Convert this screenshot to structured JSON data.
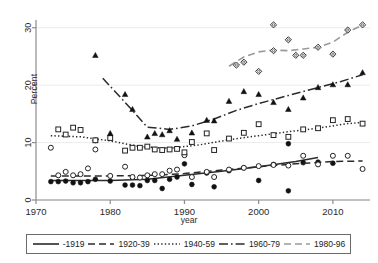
{
  "chart_data": {
    "type": "scatter",
    "title": "",
    "xlabel": "year",
    "ylabel": "Percent",
    "xlim": [
      1970,
      2015
    ],
    "ylim": [
      0,
      31
    ],
    "xticks": [
      1970,
      1980,
      1990,
      2000,
      2010
    ],
    "yticks": [
      0,
      10,
      20,
      30
    ],
    "grid": "horizontal-faint",
    "legend_position": "bottom",
    "series": [
      {
        "name": "-1919",
        "label": "-1919",
        "line_style": "solid",
        "marker": "filled-circle",
        "color": "#2b2b2b",
        "points": [
          {
            "x": 1972,
            "y": 3.2
          },
          {
            "x": 1973,
            "y": 3.2
          },
          {
            "x": 1974,
            "y": 3.3
          },
          {
            "x": 1975,
            "y": 3.0
          },
          {
            "x": 1976,
            "y": 3.0
          },
          {
            "x": 1977,
            "y": 3.2
          },
          {
            "x": 1978,
            "y": 3.6
          },
          {
            "x": 1980,
            "y": 3.3
          },
          {
            "x": 1982,
            "y": 2.6
          },
          {
            "x": 1983,
            "y": 2.6
          },
          {
            "x": 1984,
            "y": 2.5
          },
          {
            "x": 1985,
            "y": 3.4
          },
          {
            "x": 1986,
            "y": 3.4
          },
          {
            "x": 1987,
            "y": 2.0
          },
          {
            "x": 1988,
            "y": 3.6
          },
          {
            "x": 1989,
            "y": 4.0
          },
          {
            "x": 1990,
            "y": 6.3
          },
          {
            "x": 1991,
            "y": 2.7
          },
          {
            "x": 1993,
            "y": 4.7
          },
          {
            "x": 1994,
            "y": 2.3
          },
          {
            "x": 1996,
            "y": 5.1
          },
          {
            "x": 1998,
            "y": 5.6
          },
          {
            "x": 2000,
            "y": 3.4
          },
          {
            "x": 2002,
            "y": 6.2
          },
          {
            "x": 2004,
            "y": 9.8
          },
          {
            "x": 2004,
            "y": 1.6
          },
          {
            "x": 2006,
            "y": 6.5
          },
          {
            "x": 2008,
            "y": 6.6
          },
          {
            "x": 2010,
            "y": 6.4
          }
        ],
        "fit": [
          {
            "x": 1972,
            "y": 3.4
          },
          {
            "x": 1980,
            "y": 3.4
          },
          {
            "x": 1985,
            "y": 3.6
          },
          {
            "x": 1990,
            "y": 4.3
          },
          {
            "x": 1995,
            "y": 5.0
          },
          {
            "x": 2000,
            "y": 5.8
          },
          {
            "x": 2005,
            "y": 6.7
          },
          {
            "x": 2008,
            "y": 7.4
          }
        ]
      },
      {
        "name": "1920-39",
        "label": "1920-39",
        "line_style": "dashed",
        "marker": "open-circle",
        "color": "#2b2b2b",
        "points": [
          {
            "x": 1972,
            "y": 9.1
          },
          {
            "x": 1973,
            "y": 4.3
          },
          {
            "x": 1974,
            "y": 4.9
          },
          {
            "x": 1975,
            "y": 4.3
          },
          {
            "x": 1976,
            "y": 4.5
          },
          {
            "x": 1977,
            "y": 5.5
          },
          {
            "x": 1978,
            "y": 8.8
          },
          {
            "x": 1978,
            "y": 10.4
          },
          {
            "x": 1980,
            "y": 4.2
          },
          {
            "x": 1982,
            "y": 5.8
          },
          {
            "x": 1983,
            "y": 4.0
          },
          {
            "x": 1984,
            "y": 3.9
          },
          {
            "x": 1985,
            "y": 4.3
          },
          {
            "x": 1986,
            "y": 4.5
          },
          {
            "x": 1987,
            "y": 4.5
          },
          {
            "x": 1988,
            "y": 5.1
          },
          {
            "x": 1989,
            "y": 5.3
          },
          {
            "x": 1990,
            "y": 7.8
          },
          {
            "x": 1991,
            "y": 4.0
          },
          {
            "x": 1993,
            "y": 4.9
          },
          {
            "x": 1994,
            "y": 4.0
          },
          {
            "x": 1996,
            "y": 5.3
          },
          {
            "x": 1998,
            "y": 5.6
          },
          {
            "x": 2000,
            "y": 5.9
          },
          {
            "x": 2002,
            "y": 6.1
          },
          {
            "x": 2004,
            "y": 6.0
          },
          {
            "x": 2006,
            "y": 7.7
          },
          {
            "x": 2008,
            "y": 6.2
          },
          {
            "x": 2010,
            "y": 7.7
          },
          {
            "x": 2012,
            "y": 7.7
          },
          {
            "x": 2014,
            "y": 5.4
          }
        ],
        "fit": [
          {
            "x": 1972,
            "y": 4.2
          },
          {
            "x": 1980,
            "y": 4.2
          },
          {
            "x": 1986,
            "y": 4.3
          },
          {
            "x": 1990,
            "y": 4.6
          },
          {
            "x": 1995,
            "y": 5.2
          },
          {
            "x": 2000,
            "y": 5.8
          },
          {
            "x": 2005,
            "y": 6.3
          },
          {
            "x": 2010,
            "y": 6.7
          },
          {
            "x": 2014,
            "y": 6.8
          }
        ]
      },
      {
        "name": "1940-59",
        "label": "1940-59",
        "line_style": "dotted",
        "marker": "open-square",
        "color": "#2b2b2b",
        "points": [
          {
            "x": 1973,
            "y": 12.3
          },
          {
            "x": 1974,
            "y": 11.4
          },
          {
            "x": 1975,
            "y": 12.6
          },
          {
            "x": 1976,
            "y": 12.2
          },
          {
            "x": 1978,
            "y": 10.4
          },
          {
            "x": 1980,
            "y": 10.8
          },
          {
            "x": 1982,
            "y": 8.6
          },
          {
            "x": 1983,
            "y": 9.1
          },
          {
            "x": 1984,
            "y": 9.1
          },
          {
            "x": 1985,
            "y": 9.3
          },
          {
            "x": 1986,
            "y": 8.8
          },
          {
            "x": 1987,
            "y": 8.7
          },
          {
            "x": 1988,
            "y": 8.8
          },
          {
            "x": 1989,
            "y": 8.9
          },
          {
            "x": 1990,
            "y": 8.3
          },
          {
            "x": 1991,
            "y": 10.1
          },
          {
            "x": 1993,
            "y": 11.6
          },
          {
            "x": 1994,
            "y": 8.7
          },
          {
            "x": 1996,
            "y": 10.7
          },
          {
            "x": 1998,
            "y": 11.7
          },
          {
            "x": 2000,
            "y": 13.2
          },
          {
            "x": 2002,
            "y": 11.3
          },
          {
            "x": 2004,
            "y": 11.0
          },
          {
            "x": 2006,
            "y": 12.3
          },
          {
            "x": 2008,
            "y": 12.5
          },
          {
            "x": 2010,
            "y": 13.9
          },
          {
            "x": 2012,
            "y": 14.1
          },
          {
            "x": 2014,
            "y": 13.3
          }
        ],
        "fit": [
          {
            "x": 1972,
            "y": 11.2
          },
          {
            "x": 1976,
            "y": 11.0
          },
          {
            "x": 1980,
            "y": 10.3
          },
          {
            "x": 1984,
            "y": 9.3
          },
          {
            "x": 1988,
            "y": 9.0
          },
          {
            "x": 1992,
            "y": 9.6
          },
          {
            "x": 1996,
            "y": 10.5
          },
          {
            "x": 2000,
            "y": 11.2
          },
          {
            "x": 2004,
            "y": 11.9
          },
          {
            "x": 2008,
            "y": 12.5
          },
          {
            "x": 2012,
            "y": 13.3
          },
          {
            "x": 2014,
            "y": 13.5
          }
        ]
      },
      {
        "name": "1960-79",
        "label": "1960-79",
        "line_style": "dash-dot",
        "marker": "filled-triangle",
        "color": "#2b2b2b",
        "points": [
          {
            "x": 1978,
            "y": 25.2
          },
          {
            "x": 1980,
            "y": 11.6
          },
          {
            "x": 1982,
            "y": 18.4
          },
          {
            "x": 1983,
            "y": 15.8
          },
          {
            "x": 1985,
            "y": 11.0
          },
          {
            "x": 1986,
            "y": 11.6
          },
          {
            "x": 1987,
            "y": 11.4
          },
          {
            "x": 1988,
            "y": 12.1
          },
          {
            "x": 1989,
            "y": 10.6
          },
          {
            "x": 1991,
            "y": 11.7
          },
          {
            "x": 1993,
            "y": 13.9
          },
          {
            "x": 1994,
            "y": 13.8
          },
          {
            "x": 1996,
            "y": 17.2
          },
          {
            "x": 1998,
            "y": 18.9
          },
          {
            "x": 2000,
            "y": 18.4
          },
          {
            "x": 2002,
            "y": 17.0
          },
          {
            "x": 2004,
            "y": 15.8
          },
          {
            "x": 2006,
            "y": 17.8
          },
          {
            "x": 2008,
            "y": 19.6
          },
          {
            "x": 2010,
            "y": 20.1
          },
          {
            "x": 2012,
            "y": 20.1
          },
          {
            "x": 2014,
            "y": 22.2
          }
        ],
        "fit": [
          {
            "x": 1979,
            "y": 21.2
          },
          {
            "x": 1982,
            "y": 17.0
          },
          {
            "x": 1985,
            "y": 12.7
          },
          {
            "x": 1988,
            "y": 12.3
          },
          {
            "x": 1991,
            "y": 12.9
          },
          {
            "x": 1994,
            "y": 14.1
          },
          {
            "x": 1997,
            "y": 15.6
          },
          {
            "x": 2000,
            "y": 16.8
          },
          {
            "x": 2004,
            "y": 18.2
          },
          {
            "x": 2008,
            "y": 19.6
          },
          {
            "x": 2011,
            "y": 20.6
          },
          {
            "x": 2014,
            "y": 21.8
          }
        ]
      },
      {
        "name": "1980-96",
        "label": "1980-96",
        "line_style": "long-dash-light",
        "marker": "open-diamond",
        "color": "#9a9a9a",
        "points": [
          {
            "x": 1997,
            "y": 23.5
          },
          {
            "x": 1998,
            "y": 24.0
          },
          {
            "x": 2000,
            "y": 22.4
          },
          {
            "x": 2002,
            "y": 30.5
          },
          {
            "x": 2002,
            "y": 26.0
          },
          {
            "x": 2004,
            "y": 27.9
          },
          {
            "x": 2005,
            "y": 25.2
          },
          {
            "x": 2006,
            "y": 25.2
          },
          {
            "x": 2008,
            "y": 26.6
          },
          {
            "x": 2010,
            "y": 25.4
          },
          {
            "x": 2012,
            "y": 29.6
          },
          {
            "x": 2014,
            "y": 30.5
          }
        ],
        "fit": [
          {
            "x": 1996,
            "y": 23.3
          },
          {
            "x": 1998,
            "y": 24.9
          },
          {
            "x": 2000,
            "y": 25.8
          },
          {
            "x": 2002,
            "y": 26.1
          },
          {
            "x": 2004,
            "y": 26.0
          },
          {
            "x": 2006,
            "y": 26.3
          },
          {
            "x": 2008,
            "y": 26.6
          },
          {
            "x": 2010,
            "y": 27.5
          },
          {
            "x": 2012,
            "y": 29.2
          },
          {
            "x": 2014,
            "y": 30.5
          }
        ]
      }
    ]
  }
}
